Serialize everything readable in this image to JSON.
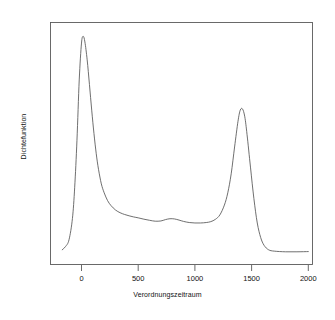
{
  "chart_data": {
    "type": "line",
    "title": "",
    "subtitle": "",
    "xlabel": "Verordnungszeitraum",
    "ylabel": "Dichtefunktion",
    "xlim": [
      -250,
      2050
    ],
    "ylim": [
      0,
      1
    ],
    "grid": false,
    "legend": null,
    "xticks": [
      0,
      500,
      1000,
      1500,
      2000
    ],
    "xticklabels": [
      "0",
      "500",
      "1000",
      "1500",
      "2000"
    ],
    "yticks": [],
    "yticklabels": [],
    "line_color": "#555555",
    "series": [
      {
        "name": "Dichtefunktion",
        "x": [
          -170,
          -140,
          -110,
          -80,
          -60,
          -40,
          -20,
          0,
          15,
          30,
          50,
          70,
          90,
          110,
          130,
          150,
          175,
          200,
          230,
          260,
          300,
          340,
          380,
          420,
          460,
          500,
          550,
          600,
          650,
          700,
          740,
          780,
          820,
          860,
          900,
          950,
          1000,
          1050,
          1100,
          1140,
          1180,
          1220,
          1260,
          1290,
          1320,
          1350,
          1380,
          1400,
          1420,
          1440,
          1460,
          1490,
          1520,
          1550,
          1580,
          1610,
          1650,
          1700,
          1800,
          1900,
          2000
        ],
        "y": [
          0.03,
          0.045,
          0.075,
          0.17,
          0.31,
          0.52,
          0.79,
          0.955,
          0.985,
          0.96,
          0.88,
          0.77,
          0.655,
          0.55,
          0.46,
          0.39,
          0.325,
          0.285,
          0.25,
          0.228,
          0.208,
          0.196,
          0.188,
          0.182,
          0.177,
          0.173,
          0.167,
          0.162,
          0.158,
          0.159,
          0.165,
          0.169,
          0.168,
          0.163,
          0.157,
          0.152,
          0.15,
          0.15,
          0.152,
          0.156,
          0.166,
          0.186,
          0.23,
          0.285,
          0.37,
          0.49,
          0.605,
          0.655,
          0.66,
          0.625,
          0.545,
          0.4,
          0.26,
          0.15,
          0.085,
          0.05,
          0.03,
          0.024,
          0.021,
          0.021,
          0.022
        ]
      }
    ]
  },
  "axes": {
    "x_title": "Verordnungszeitraum",
    "y_title": "Dichtefunktion",
    "tick_labels": [
      "0",
      "500",
      "1000",
      "1500",
      "2000"
    ]
  }
}
